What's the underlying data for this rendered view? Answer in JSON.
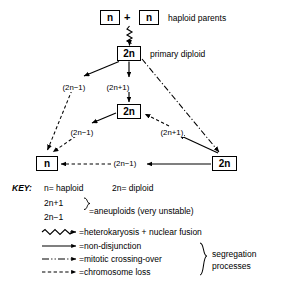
{
  "diagram": {
    "nodes": [
      {
        "id": "haploid-parent-left",
        "label": "n",
        "x": 100,
        "y": 10,
        "w": 20,
        "h": 15
      },
      {
        "id": "haploid-parent-right",
        "label": "n",
        "x": 139,
        "y": 10,
        "w": 20,
        "h": 15
      },
      {
        "id": "primary-diploid",
        "label": "2n",
        "x": 117,
        "y": 46,
        "w": 24,
        "h": 15
      },
      {
        "id": "middle-diploid",
        "label": "2n",
        "x": 117,
        "y": 104,
        "w": 24,
        "h": 15
      },
      {
        "id": "bottom-haploid",
        "label": "n",
        "x": 36,
        "y": 156,
        "w": 22,
        "h": 15
      },
      {
        "id": "bottom-diploid",
        "label": "2n",
        "x": 212,
        "y": 156,
        "w": 25,
        "h": 15
      }
    ],
    "plus_sign": "+",
    "annotations": [
      {
        "id": "haploid-parents-label",
        "text": "haploid parents",
        "x": 168,
        "y": 14
      },
      {
        "id": "primary-diploid-label",
        "text": "primary diploid",
        "x": 150,
        "y": 50
      }
    ],
    "edge_labels": [
      {
        "id": "edge-label-2n-minus-1-upper",
        "text": "(2n−1)",
        "x": 62,
        "y": 84
      },
      {
        "id": "edge-label-2n-plus-1-upper",
        "text": "(2n+1)",
        "x": 106,
        "y": 84
      },
      {
        "id": "edge-label-2n-minus-1-mid",
        "text": "(2n−1)",
        "x": 70,
        "y": 129
      },
      {
        "id": "edge-label-2n-plus-1-mid",
        "text": "(2n+1)",
        "x": 160,
        "y": 129
      },
      {
        "id": "edge-label-2n-minus-1-bottom",
        "text": "(2n−1)",
        "x": 113,
        "y": 159
      }
    ]
  },
  "key": {
    "title": "KEY:",
    "definitions": [
      {
        "id": "key-def-haploid",
        "text": "n= haploid",
        "x": 44,
        "y": 184
      },
      {
        "id": "key-def-diploid",
        "text": "2n= diploid",
        "x": 112,
        "y": 184
      }
    ],
    "aneuploid": {
      "line1": "2n+1",
      "line2": "2n−1",
      "result": "=aneuploids (very unstable)"
    },
    "legend_entries": [
      {
        "id": "legend-heterokaryosis",
        "line_style": "wavy",
        "text": "=heterokaryosis + nuclear fusion"
      },
      {
        "id": "legend-non-disjunction",
        "line_style": "solid",
        "text": "=non-disjunction"
      },
      {
        "id": "legend-mitotic-crossover",
        "line_style": "dash-dot",
        "text": "=mitotic crossing-over"
      },
      {
        "id": "legend-chromosome-loss",
        "line_style": "dashed",
        "text": "=chromosome loss"
      }
    ],
    "group_brace_label_line1": "segregation",
    "group_brace_label_line2": "processes"
  },
  "colors": {
    "ink": "#000000",
    "background": "#ffffff"
  }
}
